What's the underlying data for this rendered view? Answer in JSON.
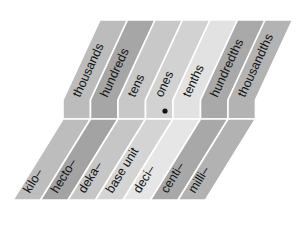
{
  "diagram": {
    "decimal_point": {
      "symbol": "•",
      "x": 165,
      "y": 111
    },
    "strips": [
      {
        "top_label": "thousands",
        "bottom_label": "kilo–",
        "top_color": "#bcbcbc",
        "bottom_color": "#bdbdbd"
      },
      {
        "top_label": "hundreds",
        "bottom_label": "hecto–",
        "top_color": "#a6a6a6",
        "bottom_color": "#a3a3a3"
      },
      {
        "top_label": "tens",
        "bottom_label": "deka–",
        "top_color": "#c8c8c8",
        "bottom_color": "#c6c6c6"
      },
      {
        "top_label": "ones",
        "bottom_label": "base unit",
        "top_color": "#d2d2d2",
        "bottom_color": "#d4d4d4"
      },
      {
        "top_label": "tenths",
        "bottom_label": "deci–",
        "top_color": "#e2e2e2",
        "bottom_color": "#e6e6e6"
      },
      {
        "top_label": "hundredths",
        "bottom_label": "centi–",
        "top_color": "#a9a9a9",
        "bottom_color": "#a8a8a8"
      },
      {
        "top_label": "thousandths",
        "bottom_label": "milli–",
        "top_color": "#b3b3b3",
        "bottom_color": "#b2b2b2"
      }
    ]
  }
}
